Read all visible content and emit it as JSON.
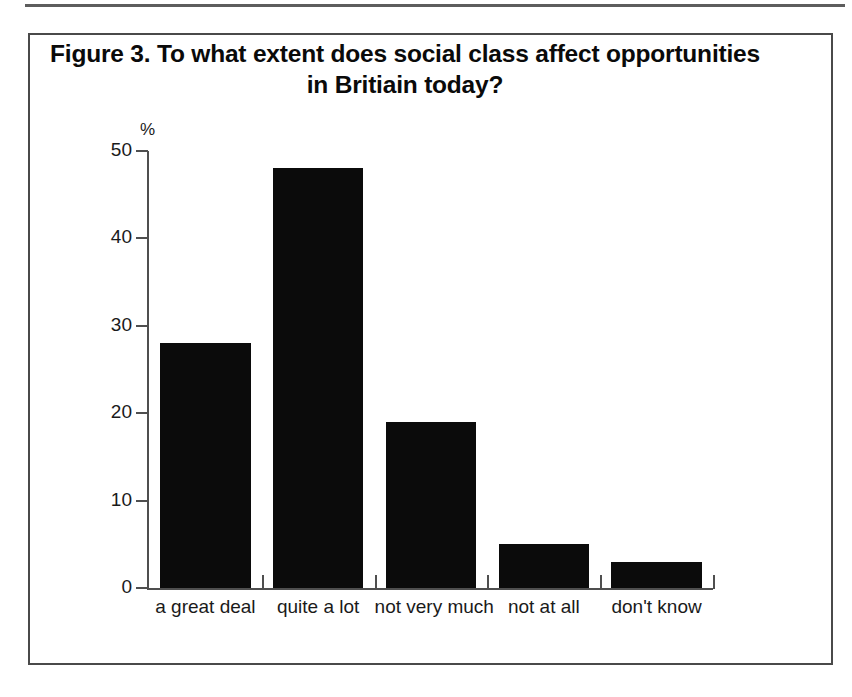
{
  "figure": {
    "title": "Figure 3. To what extent does social class affect opportunities in Britiain today?",
    "unit_label": "%"
  },
  "chart_data": {
    "type": "bar",
    "title": "Figure 3. To what extent does social class affect opportunities in Britiain today?",
    "categories": [
      "a great deal",
      "quite a lot",
      "not very much",
      "not at all",
      "don't know"
    ],
    "values": [
      28,
      48,
      19,
      5,
      3
    ],
    "xlabel": "",
    "ylabel": "%",
    "ylim": [
      0,
      50
    ],
    "yticks": [
      0,
      10,
      20,
      30,
      40,
      50
    ],
    "ytick_labels": [
      "0",
      "10",
      "20",
      "30",
      "40",
      "50"
    ],
    "grid": false,
    "legend": false,
    "bar_color": "#0b0b0b",
    "axis_color": "#4f4f4f"
  }
}
